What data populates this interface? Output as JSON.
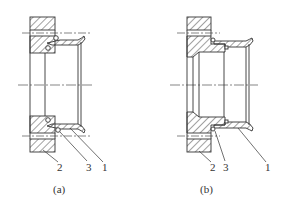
{
  "figures": [
    {
      "id": "a",
      "caption": "(a)",
      "labels": [
        {
          "text": "2",
          "part": "flange"
        },
        {
          "text": "3",
          "part": "seal-ring"
        },
        {
          "text": "1",
          "part": "pipe-flare"
        }
      ]
    },
    {
      "id": "b",
      "caption": "(b)",
      "labels": [
        {
          "text": "2",
          "part": "flange"
        },
        {
          "text": "3",
          "part": "seal-ring"
        },
        {
          "text": "1",
          "part": "pipe-flare"
        }
      ]
    }
  ],
  "colors": {
    "line": "#333333",
    "hatch": "#444444",
    "background": "#ffffff"
  }
}
